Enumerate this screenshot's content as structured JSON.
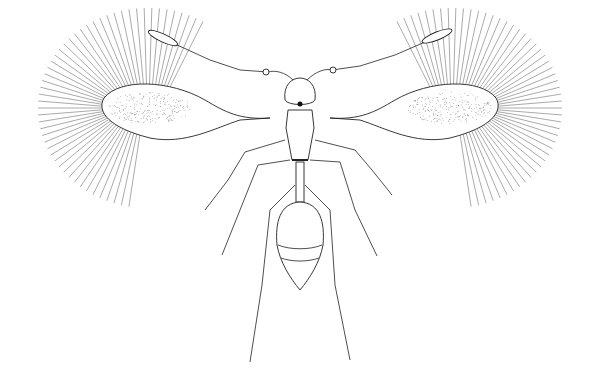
{
  "figure": {
    "colors": {
      "background": "#ffffff",
      "ink": "#222222",
      "fringe": "#555555"
    }
  }
}
